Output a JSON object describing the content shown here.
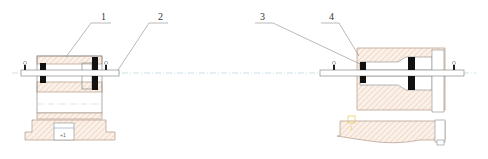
{
  "drawing": {
    "type": "mechanical-assembly-section",
    "colors": {
      "hatch_line": "#d9b8a0",
      "hatch_bg": "#fbf1e8",
      "outline": "#8a8a8a",
      "seal": "#111111",
      "centerline": "#b8d4dc",
      "marker": "#e8d060"
    },
    "callouts": [
      {
        "id": "1",
        "label": "1"
      },
      {
        "id": "2",
        "label": "2"
      },
      {
        "id": "3",
        "label": "3"
      },
      {
        "id": "4",
        "label": "4"
      }
    ],
    "annotations": {
      "left_base_mark": "+1",
      "right_base_mark": "1"
    }
  }
}
